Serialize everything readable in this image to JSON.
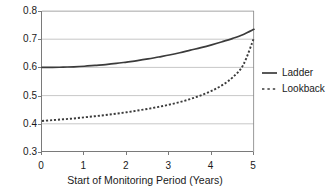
{
  "chart_data": {
    "type": "line",
    "title": "",
    "xlabel": "Start of Monitoring Period (Years)",
    "ylabel": "",
    "xlim": [
      0,
      5
    ],
    "ylim": [
      0.3,
      0.8
    ],
    "xticks": [
      "0",
      "1",
      "2",
      "3",
      "4",
      "5"
    ],
    "yticks": [
      "0.3",
      "0.4",
      "0.5",
      "0.6",
      "0.7",
      "0.8"
    ],
    "grid": "horizontal",
    "legend_position": "right",
    "x": [
      0,
      0.25,
      0.5,
      0.75,
      1,
      1.25,
      1.5,
      1.75,
      2,
      2.25,
      2.5,
      2.75,
      3,
      3.25,
      3.5,
      3.75,
      4,
      4.25,
      4.5,
      4.75,
      5
    ],
    "series": [
      {
        "name": "Ladder",
        "style": "solid",
        "color": "#3b3b3b",
        "values": [
          0.6,
          0.6,
          0.601,
          0.602,
          0.604,
          0.607,
          0.61,
          0.614,
          0.619,
          0.624,
          0.63,
          0.637,
          0.644,
          0.652,
          0.661,
          0.67,
          0.68,
          0.691,
          0.703,
          0.717,
          0.735
        ]
      },
      {
        "name": "Lookback",
        "style": "dotted",
        "color": "#3b3b3b",
        "values": [
          0.41,
          0.413,
          0.416,
          0.419,
          0.423,
          0.427,
          0.431,
          0.436,
          0.441,
          0.447,
          0.453,
          0.46,
          0.468,
          0.477,
          0.488,
          0.501,
          0.517,
          0.537,
          0.565,
          0.61,
          0.705
        ]
      }
    ]
  },
  "legend": {
    "items": [
      {
        "label": "Ladder",
        "style": "solid"
      },
      {
        "label": "Lookback",
        "style": "dotted"
      }
    ]
  }
}
